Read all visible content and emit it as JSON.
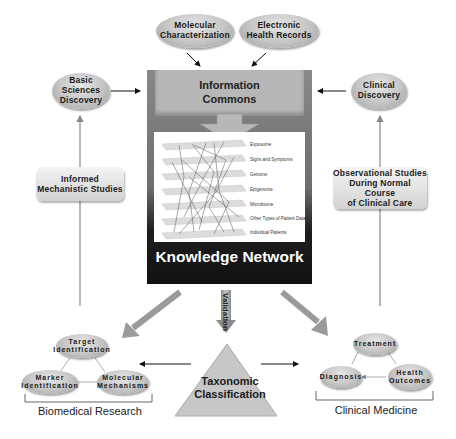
{
  "top_inputs": [
    {
      "label_line1": "Molecular",
      "label_line2": "Characterization"
    },
    {
      "label_line1": "Electronic",
      "label_line2": "Health Records"
    }
  ],
  "left_column": {
    "discovery": {
      "line1": "Basic Sciences",
      "line2": "Discovery"
    },
    "studies": {
      "line1": "Informed",
      "line2": "Mechanistic Studies"
    }
  },
  "right_column": {
    "discovery": {
      "line1": "Clinical",
      "line2": "Discovery"
    },
    "studies": {
      "line1": "Observational Studies",
      "line2": "During Normal Course",
      "line3": "of Clinical Care"
    }
  },
  "center": {
    "commons": {
      "line1": "Information",
      "line2": "Commons"
    },
    "layers": [
      "Exposome",
      "Signs and Symptoms",
      "Genome",
      "Epigenome",
      "Microbiome",
      "Other Types of Patient Data",
      "Individual Patients"
    ],
    "knowledge_network": "Knowledge Network",
    "validation": "Validation"
  },
  "taxonomy": {
    "line1": "Taxonomic",
    "line2": "Classification"
  },
  "biomedical": {
    "title": "Biomedical Research",
    "nodes": {
      "target": {
        "line1": "Target",
        "line2": "Identification"
      },
      "marker": {
        "line1": "Marker",
        "line2": "Identification"
      },
      "molecular": {
        "line1": "Molecular",
        "line2": "Mechanisms"
      }
    }
  },
  "clinical": {
    "title": "Clinical Medicine",
    "nodes": {
      "treatment": {
        "line1": "Treatment"
      },
      "diagnosis": {
        "line1": "Diagnosis"
      },
      "health": {
        "line1": "Health",
        "line2": "Outcomes"
      }
    }
  },
  "colors": {
    "node_fill": "#c4c4c4",
    "commons_fill": "#b7b7b7",
    "network_dark": "#111111",
    "arrow_fill": "#a0a0a0",
    "line": "#888888"
  }
}
